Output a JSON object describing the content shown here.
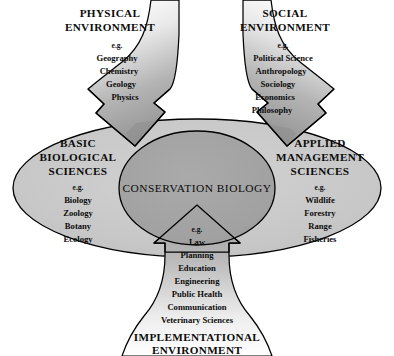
{
  "diagram": {
    "core": {
      "label": "CONSERVATION BIOLOGY"
    },
    "eg_label": "e.g.",
    "colors": {
      "outer_ellipse": "#c9c9c9",
      "core_ellipse": "#a3a3a3",
      "arrow_dark": "#9a9a9a",
      "outline": "#000000",
      "background": "#ffffff",
      "text": "#0c0c0c"
    },
    "sectors": [
      {
        "id": "physical-environment",
        "title_lines": [
          "PHYSICAL",
          "ENVIRONMENT"
        ],
        "eg": "e.g.",
        "items": [
          "Geography",
          "Chemistry",
          "Geology",
          "Physics"
        ]
      },
      {
        "id": "social-environment",
        "title_lines": [
          "SOCIAL",
          "ENVIRONMENT"
        ],
        "eg": "e.g.",
        "items": [
          "Political Science",
          "Anthropology",
          "Sociology",
          "Economics",
          "Philosophy"
        ]
      },
      {
        "id": "basic-biological-sciences",
        "title_lines": [
          "BASIC",
          "BIOLOGICAL",
          "SCIENCES"
        ],
        "eg": "e.g.",
        "items": [
          "Biology",
          "Zoology",
          "Botany",
          "Ecology"
        ]
      },
      {
        "id": "applied-management-sciences",
        "title_lines": [
          "APPLIED",
          "MANAGEMENT",
          "SCIENCES"
        ],
        "eg": "e.g.",
        "items": [
          "Wildlife",
          "Forestry",
          "Range",
          "Fisheries"
        ]
      },
      {
        "id": "implementational-environment",
        "title_lines": [
          "IMPLEMENTATIONAL",
          "ENVIRONMENT"
        ],
        "eg": "e.g.",
        "items": [
          "Law",
          "Planning",
          "Education",
          "Engineering",
          "Public Health",
          "Communication",
          "Veterinary Sciences"
        ]
      }
    ]
  }
}
